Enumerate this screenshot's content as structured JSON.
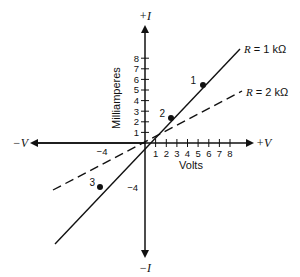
{
  "axes": {
    "x_positive_label": "+V",
    "x_negative_label": "−V",
    "y_positive_label": "+I",
    "y_negative_label": "−I",
    "x_title": "Volts",
    "y_title": "Milliamperes",
    "x_ticks": [
      "1",
      "2",
      "3",
      "4",
      "5",
      "6",
      "7",
      "8"
    ],
    "y_ticks": [
      "1",
      "2",
      "3",
      "4",
      "5",
      "6",
      "7",
      "8"
    ],
    "x_neg_label": "−4",
    "y_neg_label": "−4"
  },
  "lines": [
    {
      "label": "R = 1 kΩ",
      "style": "solid"
    },
    {
      "label": "R = 2 kΩ",
      "style": "dashed"
    }
  ],
  "points": [
    {
      "label": "1",
      "v": 5,
      "i": 5
    },
    {
      "label": "2",
      "v": 2,
      "i": 2
    },
    {
      "label": "3",
      "v": -4,
      "i": -4
    }
  ],
  "colors": {
    "ink": "#111111",
    "background": "#ffffff"
  }
}
